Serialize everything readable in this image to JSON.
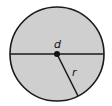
{
  "diagram": {
    "title": "",
    "shape": "circle",
    "fill_color": "#cfcfcf",
    "stroke_color": "#1a1a1a",
    "labels": {
      "diameter": "d",
      "radius": "r"
    }
  }
}
